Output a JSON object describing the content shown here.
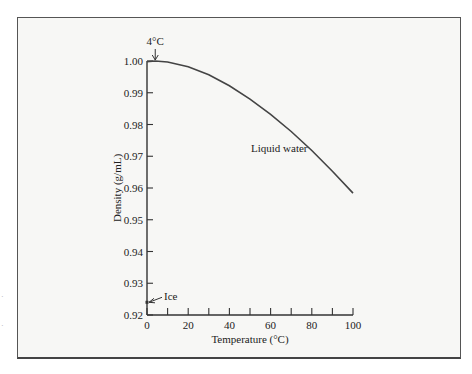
{
  "chart_data": {
    "type": "line",
    "title": "",
    "xlabel": "Temperature (°C)",
    "ylabel": "Density (g/mL)",
    "xlim": [
      0,
      100
    ],
    "ylim": [
      0.92,
      1.0
    ],
    "x_ticks": [
      "0",
      "20",
      "40",
      "60",
      "80",
      "100"
    ],
    "x_minor_ticks": [
      10,
      30,
      50,
      70,
      90
    ],
    "y_ticks": [
      "0.92",
      "0.93",
      "0.94",
      "0.95",
      "0.96",
      "0.97",
      "0.98",
      "0.99",
      "1.00"
    ],
    "grid": false,
    "legend": null,
    "series": [
      {
        "name": "Liquid water",
        "x": [
          0,
          4,
          10,
          20,
          30,
          40,
          50,
          60,
          70,
          80,
          90,
          100
        ],
        "values": [
          0.9998,
          1.0,
          0.9997,
          0.9982,
          0.9957,
          0.9922,
          0.988,
          0.9832,
          0.9778,
          0.9718,
          0.9653,
          0.9584
        ]
      },
      {
        "name": "Ice",
        "x": [
          0
        ],
        "values": [
          0.924
        ]
      }
    ],
    "annotations": [
      {
        "text": "4°C",
        "x": 4,
        "y": 1.0,
        "arrow": "down"
      },
      {
        "text": "Ice",
        "x": 0,
        "y": 0.924,
        "arrow": "left"
      },
      {
        "text": "Liquid water",
        "x": 50,
        "y": 0.975
      }
    ]
  },
  "labels": {
    "xlabel": "Temperature (°C)",
    "ylabel": "Density (g/mL)",
    "annot_4c": "4°C",
    "annot_ice": "Ice",
    "annot_liquid": "Liquid water"
  }
}
